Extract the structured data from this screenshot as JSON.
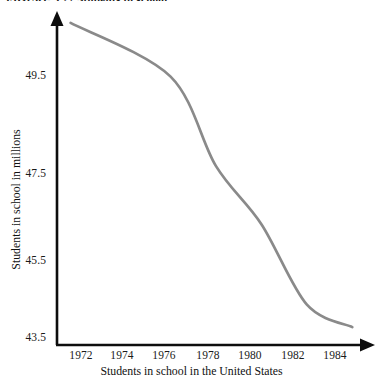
{
  "chart_data": {
    "type": "line",
    "title": "Students in school in the United States",
    "top_caption": "FIGURE 3.27 Students in school",
    "xlabel": "Students in school in the United States",
    "ylabel": "Students in school in millions",
    "x": [
      1971.6,
      1976,
      1978,
      1980,
      1982,
      1984
    ],
    "values": [
      50.7,
      49.5,
      47.5,
      46.2,
      44.4,
      43.9
    ],
    "series": [
      {
        "name": "Students in school in millions",
        "values": [
          50.7,
          49.5,
          47.5,
          46.2,
          44.4,
          43.9
        ]
      }
    ],
    "x_ticks": [
      1972,
      1974,
      1976,
      1978,
      1980,
      1982,
      1984
    ],
    "y_ticks": [
      49.5,
      47.5,
      45.5,
      43.5
    ],
    "xlim": [
      1971,
      1985
    ],
    "ylim": [
      43.5,
      50.9
    ],
    "grid": false,
    "legend": null,
    "line_color": "#8a8a8a",
    "axis_color": "#0d0d0d"
  },
  "axes": {
    "y_title": "Students in school in millions",
    "x_title": "Students in school in the United States",
    "y_tick_labels": [
      "49.5",
      "47.5",
      "45.5",
      "43.5"
    ],
    "x_tick_labels": [
      "1972",
      "1974",
      "1976",
      "1978",
      "1980",
      "1982",
      "1984"
    ]
  },
  "caption": {
    "top": "FIGURE 3.27 Students in school"
  }
}
